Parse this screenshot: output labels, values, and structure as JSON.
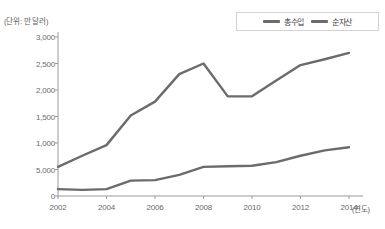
{
  "chart_data": {
    "type": "line",
    "title": "",
    "unit_note": "(단위: 만 달러)",
    "xlabel": "(연도)",
    "ylabel": "",
    "x": [
      2002,
      2003,
      2004,
      2005,
      2006,
      2007,
      2008,
      2009,
      2010,
      2011,
      2012,
      2013,
      2014
    ],
    "tick_labels_x": [
      "2002",
      "2004",
      "2006",
      "2008",
      "2010",
      "2012",
      "2014"
    ],
    "tick_values_x": [
      2002,
      2004,
      2006,
      2008,
      2010,
      2012,
      2014
    ],
    "tick_labels_y": [
      "0",
      "5,000",
      "1,000",
      "1,500",
      "2,000",
      "2,500",
      "3,000"
    ],
    "tick_values_y": [
      0,
      500,
      1000,
      1500,
      2000,
      2500,
      3000
    ],
    "ylim": [
      0,
      3000
    ],
    "xlim": [
      2002,
      2014
    ],
    "grid": false,
    "legend_position": "top-right",
    "series": [
      {
        "name": "총수입",
        "color": "#6b6b6b",
        "values": [
          550,
          760,
          960,
          1520,
          1780,
          2300,
          2500,
          1880,
          1880,
          2180,
          2470,
          2580,
          2700
        ]
      },
      {
        "name": "순자산",
        "color": "#6b6b6b",
        "values": [
          130,
          115,
          130,
          290,
          300,
          400,
          550,
          560,
          570,
          640,
          760,
          860,
          920
        ]
      }
    ]
  },
  "legend": {
    "items": [
      {
        "label": "총수입",
        "color": "#6b6b6b"
      },
      {
        "label": "순자산",
        "color": "#6b6b6b"
      }
    ]
  },
  "axes": {
    "unit_note": "(단위: 만 달러)",
    "x_axis_name": "(연도)"
  }
}
